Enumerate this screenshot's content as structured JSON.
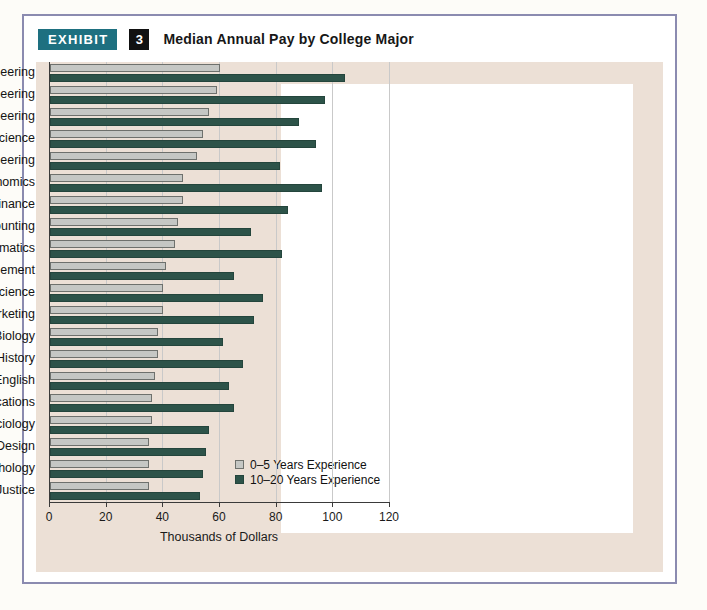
{
  "exhibit": {
    "badge_label": "EXHIBIT",
    "number": "3",
    "title": "Median Annual Pay by College Major"
  },
  "colors": {
    "badge_bg": "#1e7080",
    "number_bg": "#111111",
    "panel_bg": "#ece0d6",
    "plot_bg": "#ffffff",
    "frame_border": "#8b8bb0",
    "series_light": "#c5c7c4",
    "series_dark": "#2d5349"
  },
  "chart_data": {
    "type": "bar",
    "orientation": "horizontal",
    "title": "Median Annual Pay by College Major",
    "xlabel": "Thousands of Dollars",
    "ylabel": "",
    "xlim": [
      0,
      120
    ],
    "xticks": [
      0,
      20,
      40,
      60,
      80,
      100,
      120
    ],
    "grid": true,
    "legend_position": "inside-bottom-right",
    "categories": [
      "Computer Engineering",
      "Electrical Engineering",
      "Mechanical Engineering",
      "Computer Science",
      "Civil Engineering",
      "Economics",
      "Finance",
      "Accounting",
      "Mathematics",
      "Management",
      "Political Science",
      "Marketing",
      "Biology",
      "History",
      "English",
      "Communications",
      "Sociology",
      "Graphic Design",
      "Psychology",
      "Criminal Justice"
    ],
    "series": [
      {
        "name": "0–5 Years Experience",
        "color": "#c5c7c4",
        "values": [
          60,
          59,
          56,
          54,
          52,
          47,
          47,
          45,
          44,
          41,
          40,
          40,
          38,
          38,
          37,
          36,
          36,
          35,
          35,
          35
        ]
      },
      {
        "name": "10–20 Years Experience",
        "color": "#2d5349",
        "values": [
          104,
          97,
          88,
          94,
          81,
          96,
          84,
          71,
          82,
          65,
          75,
          72,
          61,
          68,
          63,
          65,
          56,
          55,
          54,
          53
        ]
      }
    ]
  },
  "legend": {
    "entries": [
      {
        "label": "0–5 Years Experience",
        "swatch": "light-gray-swatch"
      },
      {
        "label": "10–20 Years Experience",
        "swatch": "dark-green-swatch"
      }
    ]
  }
}
